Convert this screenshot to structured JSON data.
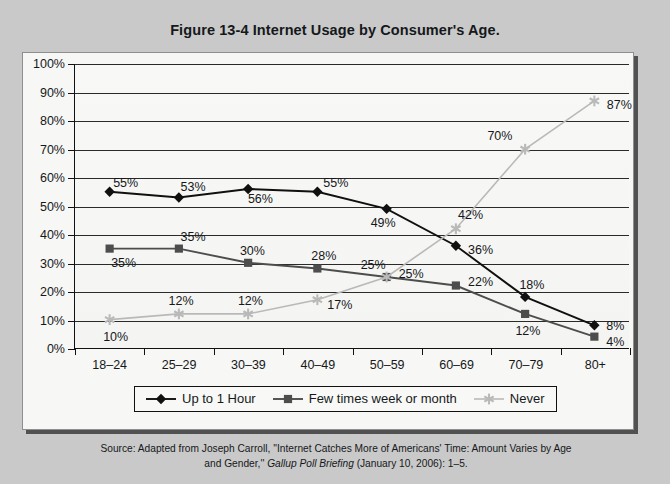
{
  "figure": {
    "title": "Figure 13-4  Internet Usage by Consumer's Age."
  },
  "source": {
    "line1_pre": "Source: Adapted from Joseph Carroll, ''Internet Catches More of Americans' Time: Amount Varies by Age",
    "line2_pre": "and Gender,'' ",
    "line2_italic": "Gallup Poll Briefing",
    "line2_post": " (January 10, 2006): 1–5."
  },
  "legend": {
    "position": "bottom",
    "items": [
      {
        "label": "Up to 1 Hour",
        "marker": "diamond",
        "color": "#101010"
      },
      {
        "label": "Few times week or month",
        "marker": "square",
        "color": "#4d4d4d"
      },
      {
        "label": "Never",
        "marker": "star",
        "color": "#b9b9b9"
      }
    ]
  },
  "chart_data": {
    "type": "line",
    "title": "Figure 13-4  Internet Usage by Consumer's Age.",
    "xlabel": "",
    "ylabel": "",
    "categories": [
      "18–24",
      "25–29",
      "30–39",
      "40–49",
      "50–59",
      "60–69",
      "70–79",
      "80+"
    ],
    "ylim": [
      0,
      100
    ],
    "yticks": [
      0,
      10,
      20,
      30,
      40,
      50,
      60,
      70,
      80,
      90,
      100
    ],
    "ytick_labels": [
      "0%",
      "10%",
      "20%",
      "30%",
      "40%",
      "50%",
      "60%",
      "70%",
      "80%",
      "90%",
      "100%"
    ],
    "grid": true,
    "units": "percent",
    "series": [
      {
        "name": "Up to 1 Hour",
        "color": "#101010",
        "marker": "diamond",
        "values": [
          55,
          53,
          56,
          55,
          49,
          36,
          18,
          8
        ],
        "labels": [
          "55%",
          "53%",
          "56%",
          "55%",
          "49%",
          "36%",
          "18%",
          "8%"
        ],
        "label_offsets": [
          [
            16,
            -9
          ],
          [
            14,
            -11
          ],
          [
            12,
            10
          ],
          [
            18,
            -9
          ],
          [
            -4,
            14
          ],
          [
            24,
            4
          ],
          [
            6,
            -13
          ],
          [
            20,
            0
          ]
        ]
      },
      {
        "name": "Few times week or month",
        "color": "#4d4d4d",
        "marker": "square",
        "values": [
          35,
          35,
          30,
          28,
          25,
          22,
          12,
          4
        ],
        "labels": [
          "35%",
          "35%",
          "30%",
          "28%",
          "25%",
          "22%",
          "12%",
          "4%"
        ],
        "label_offsets": [
          [
            14,
            14
          ],
          [
            14,
            -12
          ],
          [
            4,
            -13
          ],
          [
            6,
            -13
          ],
          [
            24,
            -4
          ],
          [
            24,
            -4
          ],
          [
            2,
            16
          ],
          [
            20,
            4
          ]
        ]
      },
      {
        "name": "Never",
        "color": "#b9b9b9",
        "marker": "star",
        "values": [
          10,
          12,
          12,
          17,
          25,
          42,
          70,
          87
        ],
        "labels": [
          "10%",
          "12%",
          "12%",
          "17%",
          "25%",
          "42%",
          "70%",
          "87%"
        ],
        "label_offsets": [
          [
            6,
            16
          ],
          [
            2,
            -14
          ],
          [
            2,
            -14
          ],
          [
            22,
            4
          ],
          [
            -14,
            -13
          ],
          [
            14,
            -14
          ],
          [
            -26,
            -14
          ],
          [
            24,
            4
          ]
        ]
      }
    ]
  }
}
